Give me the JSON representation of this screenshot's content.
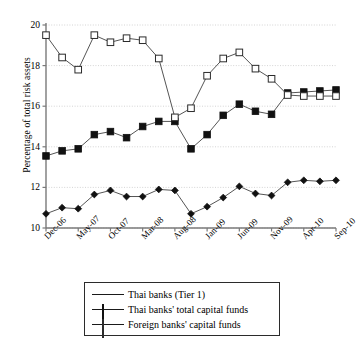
{
  "chart_data": {
    "type": "line",
    "title": "",
    "xlabel": "",
    "ylabel": "Percentage of total risk assets",
    "ylim": [
      10,
      20
    ],
    "yticks": [
      10,
      12,
      14,
      16,
      18,
      20
    ],
    "grid": true,
    "grid_axis": "y",
    "legend_position": "bottom-center",
    "x": [
      "Dec-06",
      "Feb-07",
      "May-07",
      "Jul-07",
      "Oct-07",
      "Dec-07",
      "Mar-08",
      "May-08",
      "Aug-08",
      "Oct-08",
      "Jan-09",
      "Mar-09",
      "Jun-09",
      "Aug-09",
      "Nov-09",
      "Jan-10",
      "Apr-10",
      "Jun-10",
      "Sep-10"
    ],
    "xtick_labels": [
      "Dec-06",
      "May-07",
      "Oct-07",
      "Mar-08",
      "Aug-08",
      "Jan-09",
      "Jun-09",
      "Nov-09",
      "Apr-10",
      "Sep-10"
    ],
    "xtick_indices": [
      0,
      2,
      4,
      6,
      8,
      10,
      12,
      14,
      16,
      18
    ],
    "series": [
      {
        "name": "Thai banks (Tier 1)",
        "marker": "diamond-filled",
        "color": "#111111",
        "values": [
          10.7,
          11.0,
          10.95,
          11.65,
          11.85,
          11.55,
          11.55,
          11.9,
          11.85,
          10.7,
          11.05,
          11.5,
          12.05,
          11.7,
          11.6,
          12.25,
          12.35,
          12.3,
          12.35
        ]
      },
      {
        "name": "Thai banks' total capital funds",
        "marker": "square-filled",
        "color": "#111111",
        "values": [
          13.55,
          13.8,
          13.9,
          14.6,
          14.75,
          14.45,
          15.0,
          15.25,
          15.25,
          13.9,
          14.6,
          15.55,
          16.1,
          15.75,
          15.6,
          16.65,
          16.7,
          16.75,
          16.8
        ]
      },
      {
        "name": "Foreign banks' capital funds",
        "marker": "square-open",
        "color": "#2b2b2b",
        "values": [
          19.5,
          18.4,
          17.8,
          19.5,
          19.15,
          19.35,
          19.25,
          18.35,
          15.45,
          15.9,
          17.5,
          18.35,
          18.65,
          17.85,
          17.35,
          16.55,
          16.5,
          16.5,
          16.5
        ]
      }
    ]
  },
  "legend": {
    "items": [
      {
        "label": "Thai banks (Tier 1)",
        "marker": "diamond-filled"
      },
      {
        "label": "Thai banks' total capital funds",
        "marker": "square-filled"
      },
      {
        "label": "Foreign banks' capital funds",
        "marker": "square-open"
      }
    ]
  },
  "axis": {
    "y_title": "Percentage of total risk assets",
    "y_tick_labels": [
      "20",
      "18",
      "16",
      "14",
      "12",
      "10"
    ],
    "x_tick_labels": [
      "Dec-06",
      "May-07",
      "Oct-07",
      "Mar-08",
      "Aug-08",
      "Jan-09",
      "Jun-09",
      "Nov-09",
      "Apr-10",
      "Sep-10"
    ]
  },
  "colors": {
    "axis": "#7a7a7a",
    "grid": "#c9c9c9",
    "series_dark": "#111111",
    "series_open_edge": "#2b2b2b",
    "background": "#ffffff"
  }
}
